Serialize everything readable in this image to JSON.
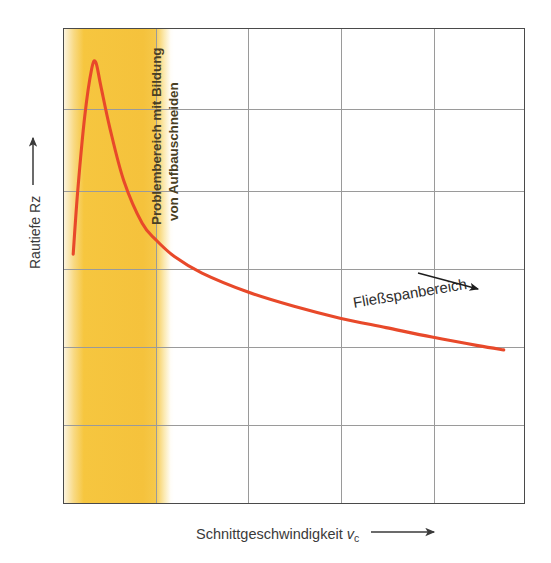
{
  "figure": {
    "background_color": "#ffffff",
    "frame_color": "#4a4a4a",
    "grid_color": "#9a9a9a"
  },
  "axes": {
    "y_label": "Rautiefe Rz",
    "y_arrow_icon": "up-arrow-icon",
    "x_label_main": "Schnittgeschwindigkeit",
    "x_label_symbol": "v",
    "x_label_subscript": "c",
    "x_arrow_icon": "right-arrow-icon"
  },
  "annotations": {
    "band_caption_line1": "Problembereich mit Bildung",
    "band_caption_line2": "von Aufbauschneiden",
    "band_color": "#f5c23c",
    "band_text_color": "#4a3f23",
    "curve_region_label": "Fließspanbereich",
    "curve_pointer_icon": "arrow-pointer-icon"
  },
  "chart_data": {
    "type": "line",
    "title": "",
    "xlabel": "Schnittgeschwindigkeit vc",
    "ylabel": "Rautiefe Rz",
    "grid": true,
    "legend": null,
    "axis_ticks": {
      "x": [],
      "y": []
    },
    "xlim": [
      0,
      100
    ],
    "ylim": [
      0,
      100
    ],
    "series": [
      {
        "name": "Rautiefe Rz über Schnittgeschwindigkeit",
        "color": "#e8492a",
        "x": [
          2.0,
          3.0,
          4.5,
          6.0,
          6.9,
          8.0,
          10.0,
          13.0,
          17.0,
          20.0,
          24.0,
          30.0,
          40.0,
          50.0,
          60.0,
          70.0,
          80.0,
          90.0,
          95.6
        ],
        "y": [
          52.5,
          66.0,
          81.5,
          91.5,
          93.0,
          88.0,
          79.0,
          68.0,
          59.0,
          55.5,
          52.0,
          48.5,
          44.5,
          41.5,
          39.0,
          37.0,
          35.0,
          33.2,
          32.3
        ]
      }
    ],
    "shaded_regions": [
      {
        "name": "Problembereich mit Bildung von Aufbauschneiden",
        "x_start": 0,
        "x_end": 23.8,
        "color": "#f5c23c"
      }
    ],
    "gridlines": {
      "vertical_x": [
        19.9,
        39.8,
        59.9,
        80.1
      ],
      "horizontal_y": [
        16.8,
        33.2,
        49.6,
        66.0,
        83.2
      ]
    }
  }
}
